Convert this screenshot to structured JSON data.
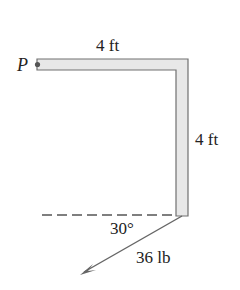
{
  "diagram": {
    "point_label": "P",
    "horizontal_length": "4 ft",
    "vertical_length": "4 ft",
    "angle": "30°",
    "force": "36 lb"
  },
  "colors": {
    "bar_fill": "#e8e8e8",
    "bar_stroke": "#707070",
    "line": "#555555",
    "arrow": "#666666"
  }
}
